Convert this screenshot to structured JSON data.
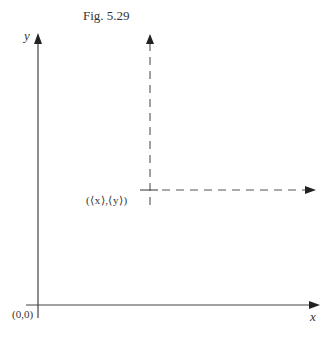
{
  "figure": {
    "caption": "Fig. 5.29",
    "y_axis_label": "y",
    "x_axis_label": "x",
    "origin_label": "(0,0)",
    "point_label": "(⟨x⟩,⟨y⟩)"
  },
  "colors": {
    "line": "#444444",
    "dashed": "#555555"
  }
}
